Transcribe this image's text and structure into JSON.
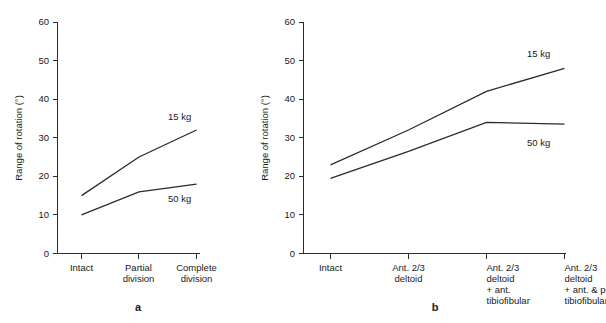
{
  "figure": {
    "background_color": "#ffffff",
    "line_color": "#2b2b2b",
    "text_color": "#1a1a1a"
  },
  "panels": [
    {
      "letter": "a",
      "ylabel": "Range of rotation (°)",
      "yticks": [
        "0",
        "10",
        "20",
        "30",
        "40",
        "50",
        "60"
      ],
      "xticks": [
        {
          "lines": [
            "Intact"
          ]
        },
        {
          "lines": [
            "Partial",
            "division"
          ]
        },
        {
          "lines": [
            "Complete",
            "division"
          ]
        }
      ],
      "series": [
        {
          "name": "15 kg",
          "label": "15 kg"
        },
        {
          "name": "50 kg",
          "label": "50 kg"
        }
      ]
    },
    {
      "letter": "b",
      "ylabel": "Range of rotation (°)",
      "yticks": [
        "0",
        "10",
        "20",
        "30",
        "40",
        "50",
        "60"
      ],
      "xticks": [
        {
          "lines": [
            "Intact"
          ]
        },
        {
          "lines": [
            "Ant. 2/3",
            "deltoid"
          ]
        },
        {
          "lines": [
            "Ant. 2/3",
            "deltoid",
            "+ ant.",
            "tibiofibular"
          ]
        },
        {
          "lines": [
            "Ant. 2/3",
            "deltoid",
            "+ ant. & post.",
            "tibiofibular"
          ]
        }
      ],
      "series": [
        {
          "name": "15 kg",
          "label": "15 kg"
        },
        {
          "name": "50 kg",
          "label": "50 kg"
        }
      ]
    }
  ],
  "chart_data": [
    {
      "type": "line",
      "panel": "a",
      "title": "",
      "xlabel": "",
      "ylabel": "Range of rotation (°)",
      "categories": [
        "Intact",
        "Partial division",
        "Complete division"
      ],
      "ylim": [
        0,
        60
      ],
      "ytick_values": [
        0,
        10,
        20,
        30,
        40,
        50,
        60
      ],
      "grid": false,
      "legend": "inline-end-labels",
      "series": [
        {
          "name": "15 kg",
          "values": [
            15,
            25,
            32
          ]
        },
        {
          "name": "50 kg",
          "values": [
            10,
            16,
            18
          ]
        }
      ]
    },
    {
      "type": "line",
      "panel": "b",
      "title": "",
      "xlabel": "",
      "ylabel": "Range of rotation (°)",
      "categories": [
        "Intact",
        "Ant. 2/3 deltoid",
        "Ant. 2/3 deltoid + ant. tibiofibular",
        "Ant. 2/3 deltoid + ant. & post. tibiofibular"
      ],
      "ylim": [
        0,
        60
      ],
      "ytick_values": [
        0,
        10,
        20,
        30,
        40,
        50,
        60
      ],
      "grid": false,
      "legend": "inline-end-labels",
      "series": [
        {
          "name": "15 kg",
          "values": [
            23,
            32,
            42,
            48
          ]
        },
        {
          "name": "50 kg",
          "values": [
            19.5,
            26.5,
            34,
            33.5
          ]
        }
      ]
    }
  ]
}
